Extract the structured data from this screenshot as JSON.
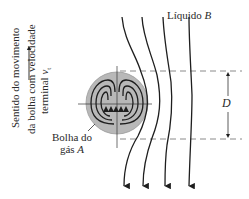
{
  "labels": {
    "liquid": "Líquido ",
    "liquid_var": "B",
    "bubble_line1": "Bolha do",
    "bubble_line2": "gás ",
    "bubble_var": "A",
    "dimension": "D",
    "direction_line1": "Sentido do movimento",
    "direction_line2": "da bolha com velocidade",
    "direction_line3": "terminal ",
    "direction_var": "v",
    "direction_sub": "t"
  },
  "colors": {
    "bubble_fill": "#b8b8b8",
    "stroke": "#1e1e1e",
    "dashed": "#8a8a8a"
  }
}
